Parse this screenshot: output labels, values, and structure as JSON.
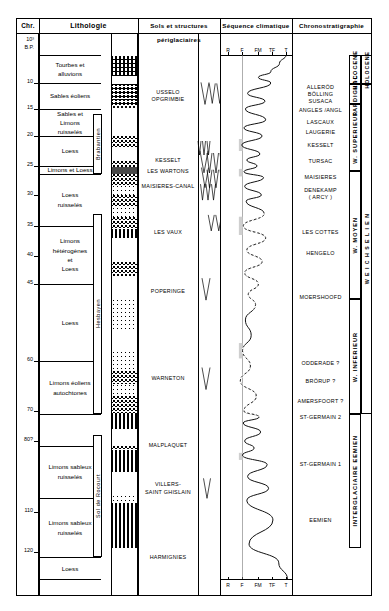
{
  "figure": {
    "type": "stratigraphic-column",
    "headers": {
      "chr": "Chr.",
      "lithology": "Lithologie",
      "soils": "Sols et structures périglaciaires",
      "climate": "Séquence climatique",
      "chronostratigraphy": "Chronostratigraphie"
    },
    "depth_axis": {
      "unit_top_label": "10³",
      "unit_top_label2": "B.P.",
      "ticks": [
        10,
        15,
        20,
        25,
        30,
        35,
        40,
        45,
        60,
        70,
        80,
        110,
        120
      ],
      "tick_labels": [
        "10",
        "15",
        "20",
        "25",
        "30",
        "35",
        "40",
        "45",
        "60",
        "70",
        "80?",
        "110",
        "120"
      ]
    },
    "lithology_units": [
      {
        "lines": [
          "Tourbes  et",
          "alluvions"
        ]
      },
      {
        "lines": [
          "Sables  éoliens"
        ]
      },
      {
        "lines": [
          "Sables  et",
          "Limons",
          "ruisselés"
        ]
      },
      {
        "lines": [
          "Loess"
        ]
      },
      {
        "lines": [
          "Limons et Loess"
        ]
      },
      {
        "lines": [
          "Loess",
          "ruisselés"
        ]
      },
      {
        "lines": [
          "Limons",
          "hétérogènes",
          "et",
          "Loess"
        ]
      },
      {
        "lines": [
          "Loess"
        ]
      },
      {
        "lines": [
          "Limons  éoliens",
          "autochtones"
        ]
      },
      {
        "lines": [
          "Limons sableux",
          "ruisselés"
        ]
      },
      {
        "lines": [
          "Limons sableux",
          "ruisselés"
        ]
      },
      {
        "lines": [
          "Loess"
        ]
      }
    ],
    "soil_complexes": [
      {
        "label": "Brabantien"
      },
      {
        "label": "Hesbayen"
      },
      {
        "label": "Sol de Rocourt"
      }
    ],
    "periglacial_soils": [
      {
        "lines": [
          "USSELO",
          "OPGRIMBIE"
        ]
      },
      {
        "lines": [
          "KESSELT"
        ]
      },
      {
        "lines": [
          "LES WARTONS"
        ]
      },
      {
        "lines": [
          "MAISIERES-CANAL"
        ]
      },
      {
        "lines": [
          "LES VAUX"
        ]
      },
      {
        "lines": [
          "POPERINGE"
        ]
      },
      {
        "lines": [
          "WARNETON"
        ]
      },
      {
        "lines": [
          "MALPLAQUET"
        ]
      },
      {
        "lines": [
          "VILLERS-",
          "SAINT GHISLAIN"
        ]
      },
      {
        "lines": [
          "HARMIGNIES"
        ]
      }
    ],
    "climate_axis": {
      "labels": [
        "R",
        "F",
        "FM",
        "TF",
        "T"
      ],
      "note": "R = rigoureux, F = froid, FM = froid modéré, TF = tempéré frais, T = tempéré"
    },
    "chrono_events": [
      {
        "lines": [
          "ALLERÖD",
          "BÖLLING",
          "SUSACA"
        ]
      },
      {
        "lines": [
          "ANGLES /ANGL"
        ]
      },
      {
        "lines": [
          "LASCAUX"
        ]
      },
      {
        "lines": [
          "LAUGERIE"
        ]
      },
      {
        "lines": [
          "KESSELT"
        ]
      },
      {
        "lines": [
          "TURSAC"
        ]
      },
      {
        "lines": [
          "MAISIERES"
        ]
      },
      {
        "lines": [
          "DENEKAMP",
          "( ARCY )"
        ]
      },
      {
        "lines": [
          "LES COTTES"
        ]
      },
      {
        "lines": [
          "HENGELO"
        ]
      },
      {
        "lines": [
          "MOERSHOOFD"
        ]
      },
      {
        "lines": [
          "ODDERADE ?"
        ]
      },
      {
        "lines": [
          "BRÖRUP ?"
        ]
      },
      {
        "lines": [
          "AMERSFOORT ?"
        ]
      },
      {
        "lines": [
          "ST-GERMAIN 2"
        ]
      },
      {
        "lines": [
          "ST-GERMAIN 1"
        ]
      },
      {
        "lines": [
          "EEMIEN"
        ]
      }
    ],
    "chrono_stages_inner": [
      {
        "label": "HOLOCENE"
      },
      {
        "label": "TARDIGLAC."
      },
      {
        "label": "W. SUPERIEUR"
      },
      {
        "label": "W. MOYEN"
      },
      {
        "label": "W. INFERIEUR"
      },
      {
        "label": "INTERGLACIAIRE EEMIEN"
      }
    ],
    "chrono_stages_outer": [
      {
        "label": "HOLOCENE"
      },
      {
        "label": "W E I C H S E L I E N"
      }
    ],
    "colors": {
      "ink": "#000000",
      "paper": "#ffffff",
      "fill_gray": "#cfcfcf",
      "rule": "#555555"
    }
  },
  "chart_data": {
    "type": "line",
    "title": "Séquence climatique",
    "xlabel": "",
    "ylabel": "10³ B.P.",
    "x_categories": [
      "R",
      "F",
      "FM",
      "TF",
      "T"
    ],
    "ylim": [
      0,
      130
    ],
    "grid": false,
    "legend": "none",
    "series": [
      {
        "name": "Courbe climatique",
        "comment": "paleoclimate curve: x = climate class index 0(R)..4(T), y = age in 10^3 years BP",
        "points": [
          [
            4.0,
            0
          ],
          [
            3.55,
            3
          ],
          [
            2.95,
            6
          ],
          [
            2.1,
            8
          ],
          [
            2.95,
            10
          ],
          [
            1.35,
            12
          ],
          [
            2.55,
            13.5
          ],
          [
            1.2,
            15
          ],
          [
            2.6,
            17
          ],
          [
            1.1,
            18.5
          ],
          [
            2.35,
            20
          ],
          [
            0.95,
            21.5
          ],
          [
            2.2,
            23
          ],
          [
            1.3,
            24
          ],
          [
            2.0,
            25
          ],
          [
            1.1,
            26
          ],
          [
            2.45,
            27
          ],
          [
            1.15,
            28.5
          ],
          [
            2.3,
            30
          ],
          [
            1.25,
            31
          ],
          [
            2.5,
            33
          ],
          [
            1.05,
            35
          ],
          [
            2.6,
            37
          ],
          [
            1.3,
            39
          ],
          [
            2.35,
            41
          ],
          [
            1.15,
            43
          ],
          [
            2.1,
            45
          ],
          [
            1.4,
            47
          ],
          [
            1.9,
            49
          ],
          [
            1.2,
            52
          ],
          [
            1.6,
            55
          ],
          [
            1.0,
            58
          ],
          [
            1.55,
            61
          ],
          [
            0.85,
            64
          ],
          [
            1.95,
            67
          ],
          [
            1.1,
            70
          ],
          [
            2.15,
            72
          ],
          [
            1.05,
            74
          ],
          [
            2.25,
            77
          ],
          [
            1.15,
            80
          ],
          [
            1.8,
            83
          ],
          [
            1.0,
            86
          ],
          [
            2.7,
            90
          ],
          [
            1.35,
            95
          ],
          [
            2.8,
            100
          ],
          [
            1.3,
            105
          ],
          [
            3.1,
            112
          ],
          [
            1.45,
            118
          ],
          [
            3.5,
            124
          ],
          [
            4.1,
            130
          ]
        ],
        "style": "solid-with-dashed-segments"
      }
    ],
    "annotations": [
      "Shaded (gray) areas mark cold / rigorous intervals to the left of the F reference line",
      "Dashed portions of the curve indicate uncertain correlation (ca. 33-50 and 58-70 ka)"
    ]
  }
}
